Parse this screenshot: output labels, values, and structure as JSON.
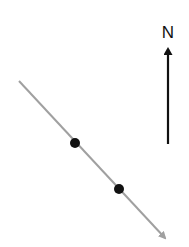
{
  "diagram": {
    "north_label": "N",
    "colors": {
      "background": "#ffffff",
      "line": "#a0a0a0",
      "dots": "#111111",
      "north_arrow": "#111111"
    },
    "line": {
      "x1": 19,
      "y1": 81,
      "x2": 167,
      "y2": 240
    },
    "dots": [
      {
        "cx": 75,
        "cy": 143,
        "r": 5
      },
      {
        "cx": 119,
        "cy": 189,
        "r": 5
      }
    ],
    "north_arrow": {
      "x": 168,
      "y_bottom": 144,
      "y_tip": 45
    }
  }
}
